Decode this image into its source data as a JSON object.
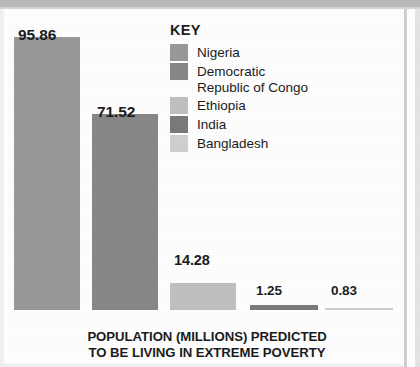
{
  "caption": {
    "line1": "POPULATION (MILLIONS) PREDICTED",
    "line2": "TO BE LIVING IN EXTREME POVERTY"
  },
  "legend": {
    "title": "KEY",
    "items": [
      {
        "label": "Nigeria",
        "label2": "",
        "color": "#989898"
      },
      {
        "label": "Democratic",
        "label2": "Republic of Congo",
        "color": "#878787"
      },
      {
        "label": "Ethiopia",
        "label2": "",
        "color": "#c0c0c0"
      },
      {
        "label": "India",
        "label2": "",
        "color": "#7a7a7a"
      },
      {
        "label": "Bangladesh",
        "label2": "",
        "color": "#cfcfcf"
      }
    ]
  },
  "bars": [
    {
      "name": "Nigeria",
      "value_label": "95.86"
    },
    {
      "name": "Democratic Republic of Congo",
      "value_label": "71.52"
    },
    {
      "name": "Ethiopia",
      "value_label": "14.28"
    },
    {
      "name": "India",
      "value_label": "1.25"
    },
    {
      "name": "Bangladesh",
      "value_label": "0.83"
    }
  ],
  "chart_data": {
    "type": "bar",
    "title": "POPULATION (MILLIONS) PREDICTED TO BE LIVING IN EXTREME POVERTY",
    "subtitle": "",
    "xlabel": "",
    "ylabel": "Population (millions)",
    "categories": [
      "Nigeria",
      "Democratic Republic of Congo",
      "Ethiopia",
      "India",
      "Bangladesh"
    ],
    "values": [
      95.86,
      71.52,
      14.28,
      1.25,
      0.83
    ],
    "data_labels": [
      "95.86",
      "71.52",
      "14.28",
      "1.25",
      "0.83"
    ],
    "ylim": [
      0,
      95.86
    ],
    "grid": false,
    "axis_visible": false,
    "tick_labels": [],
    "legend": {
      "title": "KEY",
      "position": "inside-top-right",
      "entries": [
        "Nigeria",
        "Democratic Republic of Congo",
        "Ethiopia",
        "India",
        "Bangladesh"
      ]
    },
    "series_colors": [
      "#989898",
      "#878787",
      "#c0c0c0",
      "#7a7a7a",
      "#cfcfcf"
    ]
  },
  "geometry": {
    "baseline_y": 299,
    "bar_width": 66,
    "bar_lefts": [
      10,
      88,
      166,
      246,
      321
    ],
    "bar_heights": [
      273,
      196,
      27,
      5,
      2
    ],
    "bar_widths": [
      66,
      66,
      66,
      68,
      68
    ],
    "label_positions": [
      {
        "left": 14,
        "top": 15
      },
      {
        "left": 93,
        "top": 92
      },
      {
        "left": 170,
        "top": 241
      },
      {
        "left": 252,
        "top": 272
      },
      {
        "left": 327,
        "top": 272
      }
    ],
    "label_sizes": [
      15.5,
      15.5,
      14.5,
      13.5,
      13.5
    ]
  }
}
